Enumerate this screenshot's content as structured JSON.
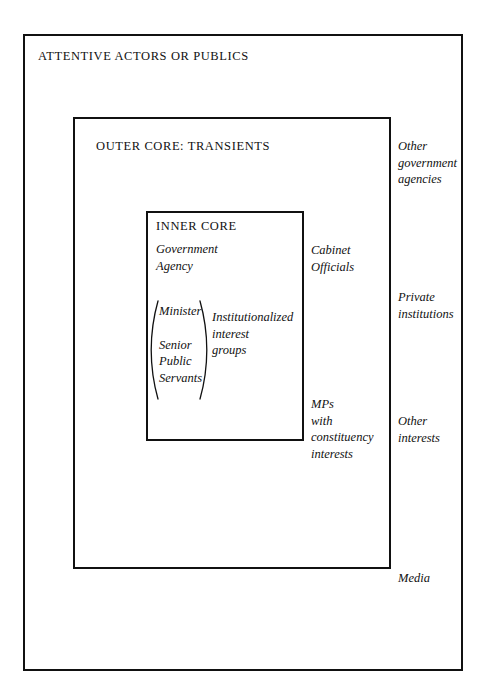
{
  "diagram": {
    "outer_box": {
      "label": "ATTENTIVE ACTORS OR PUBLICS"
    },
    "middle_box": {
      "label": "OUTER CORE: TRANSIENTS"
    },
    "inner_box": {
      "label": "INNER CORE",
      "agency": "Government\nAgency",
      "interest_groups": "Institutionalized\ninterest\ngroups",
      "bracket_group": {
        "open_paren": "(",
        "close_paren": ")",
        "first": "Minister",
        "rest": "Senior\nPublic\nServants"
      }
    },
    "outer_core_actors": [
      {
        "name": "cabinet-officials",
        "text": "Cabinet\nOfficials"
      },
      {
        "name": "mps-constituency",
        "text": "MPs\nwith\nconstituency\ninterests"
      }
    ],
    "attentive_actors": [
      {
        "name": "other-government-agencies",
        "text": "Other\ngovernment\nagencies"
      },
      {
        "name": "private-institutions",
        "text": "Private\ninstitutions"
      },
      {
        "name": "other-interests",
        "text": "Other\ninterests"
      },
      {
        "name": "media",
        "text": "Media"
      }
    ],
    "colors": {
      "background": "#ffffff",
      "stroke": "#111111",
      "text": "#111111"
    }
  }
}
